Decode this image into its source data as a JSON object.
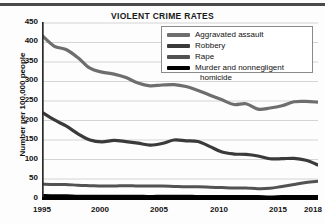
{
  "figure": {
    "title": "VIOLENT CRIME RATES",
    "ylabel": "Number per 100,000 people"
  },
  "legend": {
    "items": [
      {
        "label": "Aggravated assault",
        "color": "#6e6e6e"
      },
      {
        "label": "Robbery",
        "color": "#3a3a3a"
      },
      {
        "label": "Rape",
        "color": "#525252"
      },
      {
        "label": "Murder and nonnegligent",
        "label2": "homicide",
        "color": "#000000"
      }
    ]
  },
  "axes": {
    "y_ticks": [
      "450",
      "400",
      "350",
      "300",
      "250",
      "200",
      "150",
      "100",
      "50",
      "0"
    ],
    "x_ticks": [
      "1995",
      "2000",
      "2005",
      "2010",
      "2015",
      "2018"
    ]
  },
  "chart_data": {
    "type": "line",
    "title": "VIOLENT CRIME RATES",
    "xlabel": "",
    "ylabel": "Number per 100,000 people",
    "xlim": [
      1995,
      2018
    ],
    "ylim": [
      0,
      450
    ],
    "grid": true,
    "legend_position": "top-right",
    "x": [
      1995,
      1996,
      1997,
      1998,
      1999,
      2000,
      2001,
      2002,
      2003,
      2004,
      2005,
      2006,
      2007,
      2008,
      2009,
      2010,
      2011,
      2012,
      2013,
      2014,
      2015,
      2016,
      2017,
      2018
    ],
    "series": [
      {
        "name": "Aggravated assault",
        "color": "#6e6e6e",
        "values": [
          418,
          391,
          382,
          361,
          334,
          324,
          319,
          310,
          296,
          289,
          291,
          292,
          287,
          277,
          265,
          253,
          241,
          243,
          229,
          232,
          238,
          248,
          249,
          247
        ]
      },
      {
        "name": "Robbery",
        "color": "#3a3a3a",
        "values": [
          221,
          202,
          186,
          166,
          150,
          145,
          149,
          146,
          142,
          137,
          141,
          150,
          148,
          146,
          133,
          119,
          114,
          113,
          109,
          102,
          102,
          103,
          98,
          86
        ]
      },
      {
        "name": "Rape",
        "color": "#525252",
        "values": [
          37,
          36,
          36,
          34,
          33,
          32,
          32,
          33,
          32,
          32,
          32,
          31,
          30,
          30,
          29,
          28,
          27,
          27,
          25,
          26,
          31,
          36,
          41,
          44
        ]
      },
      {
        "name": "Murder and nonnegligent homicide",
        "color": "#000000",
        "values": [
          8,
          7,
          7,
          6,
          6,
          6,
          6,
          6,
          6,
          5,
          6,
          6,
          6,
          5,
          5,
          5,
          5,
          5,
          5,
          4,
          5,
          5,
          5,
          5
        ]
      }
    ]
  }
}
